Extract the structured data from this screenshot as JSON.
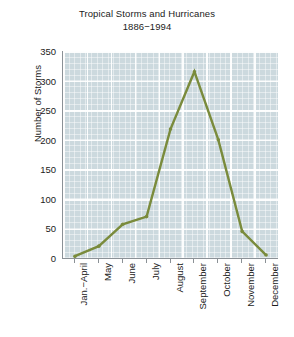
{
  "chart_data": {
    "type": "line",
    "title": "Tropical Storms and Hurricanes",
    "subtitle": "1886−1994",
    "xlabel": "",
    "ylabel": "Number of Storms",
    "categories": [
      "Jan.−April",
      "May",
      "June",
      "July",
      "August",
      "September",
      "October",
      "November",
      "December"
    ],
    "values": [
      3,
      20,
      57,
      70,
      218,
      315,
      200,
      45,
      5
    ],
    "series": [
      {
        "name": "Number of Storms",
        "values": [
          3,
          20,
          57,
          70,
          218,
          315,
          200,
          45,
          5
        ]
      }
    ],
    "ylim": [
      0,
      350
    ],
    "yticks": [
      0,
      50,
      100,
      150,
      200,
      250,
      300,
      350
    ],
    "ytick_labels": [
      "0",
      "50",
      "100",
      "150",
      "200",
      "250",
      "300",
      "350"
    ],
    "grid": true,
    "legend": "none",
    "line_color": "#7a8b3c",
    "marker": "point",
    "plot_background": "#ccd9de",
    "gridline_color": "#ffffff",
    "axis_color": "#8b9196",
    "text_color": "#1b1b1b"
  }
}
